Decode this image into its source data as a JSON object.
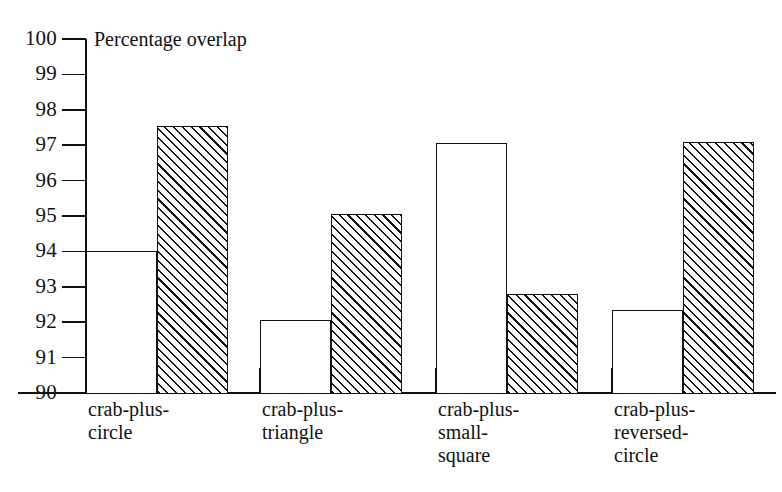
{
  "chart_data": {
    "type": "bar",
    "title": "Percentage overlap",
    "xlabel": "",
    "ylabel": "",
    "ylim": [
      90,
      100
    ],
    "grid": false,
    "legend": "none",
    "y_ticks": [
      "100",
      "99",
      "98",
      "97",
      "96",
      "95",
      "94",
      "93",
      "92",
      "91",
      "90"
    ],
    "y_tick_values": [
      100,
      99,
      98,
      97,
      96,
      95,
      94,
      93,
      92,
      91,
      90
    ],
    "categories": [
      "crab-plus-circle",
      "crab-plus-triangle",
      "crab-plus-small-square",
      "crab-plus-reversed-circle"
    ],
    "category_label_lines": [
      [
        "crab-plus-",
        "circle"
      ],
      [
        "crab-plus-",
        "triangle"
      ],
      [
        "crab-plus-",
        "small-",
        "square"
      ],
      [
        "crab-plus-",
        "reversed-",
        "circle"
      ]
    ],
    "series": [
      {
        "name": "plain",
        "fill": "white",
        "values": [
          94.0,
          92.05,
          97.05,
          92.35
        ]
      },
      {
        "name": "hatched",
        "fill": "diagonal-hatch",
        "values": [
          97.55,
          95.05,
          92.8,
          97.1
        ]
      }
    ],
    "colors": {
      "ink": "#111111",
      "background": "#ffffff"
    }
  }
}
